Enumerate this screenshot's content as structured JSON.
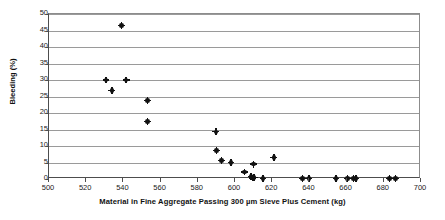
{
  "chart_data": {
    "type": "scatter",
    "title": "",
    "xlabel": "Material in Fine Aggregate Passing 300 µm Sieve Plus Cement (kg)",
    "ylabel": "Bleeding (%)",
    "xlim": [
      500,
      700
    ],
    "ylim": [
      0,
      50
    ],
    "xticks": [
      500,
      520,
      540,
      560,
      580,
      600,
      620,
      640,
      660,
      680,
      700
    ],
    "yticks": [
      0,
      5,
      10,
      15,
      20,
      25,
      30,
      35,
      40,
      45,
      50
    ],
    "grid": "horizontal",
    "legend": "none",
    "marker": "filled-circle-with-cross",
    "marker_color": "#111111",
    "gridline_color": "#9a9a9a",
    "axis_color": "#4d4d4d",
    "background": "#ffffff",
    "series": [
      {
        "name": "Bleeding vs Fine Material",
        "points": [
          {
            "x": 530.6,
            "y": 30.0
          },
          {
            "x": 533.8,
            "y": 26.8
          },
          {
            "x": 538.9,
            "y": 46.5
          },
          {
            "x": 541.5,
            "y": 30.0
          },
          {
            "x": 552.8,
            "y": 23.8
          },
          {
            "x": 552.9,
            "y": 17.5
          },
          {
            "x": 589.7,
            "y": 14.3
          },
          {
            "x": 590.0,
            "y": 8.6
          },
          {
            "x": 592.8,
            "y": 5.6
          },
          {
            "x": 597.8,
            "y": 5.0
          },
          {
            "x": 605.1,
            "y": 2.1
          },
          {
            "x": 608.6,
            "y": 0.7
          },
          {
            "x": 609.3,
            "y": 0.3
          },
          {
            "x": 609.8,
            "y": 4.5
          },
          {
            "x": 610.3,
            "y": 0.5
          },
          {
            "x": 615.1,
            "y": 0.2
          },
          {
            "x": 620.9,
            "y": 6.6
          },
          {
            "x": 636.3,
            "y": 0.1
          },
          {
            "x": 639.8,
            "y": 0.1
          },
          {
            "x": 654.3,
            "y": 0.2
          },
          {
            "x": 660.4,
            "y": 0.2
          },
          {
            "x": 663.6,
            "y": 0.2
          },
          {
            "x": 665.0,
            "y": 0.2
          },
          {
            "x": 683.0,
            "y": 0.1
          },
          {
            "x": 686.2,
            "y": 0.1
          }
        ]
      }
    ]
  }
}
